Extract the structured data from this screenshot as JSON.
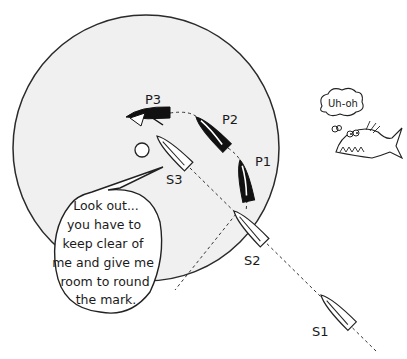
{
  "diagram": {
    "zone_circle": {
      "cx": 146,
      "cy": 148,
      "r": 133,
      "fill": "#f0f0f0",
      "stroke": "#2a2a2a"
    },
    "mark": {
      "cx": 142,
      "cy": 150,
      "r": 7
    },
    "boats": [
      {
        "id": "S1",
        "label": "S1",
        "color": "white",
        "label_pos": [
          312,
          336
        ]
      },
      {
        "id": "S2",
        "label": "S2",
        "color": "white",
        "label_pos": [
          244,
          265
        ]
      },
      {
        "id": "S3",
        "label": "S3",
        "color": "white",
        "label_pos": [
          166,
          184
        ]
      },
      {
        "id": "P1",
        "label": "P1",
        "color": "black",
        "label_pos": [
          255,
          166
        ]
      },
      {
        "id": "P2",
        "label": "P2",
        "color": "black",
        "label_pos": [
          222,
          124
        ]
      },
      {
        "id": "P3",
        "label": "P3",
        "color": "black",
        "label_pos": [
          145,
          104
        ]
      }
    ],
    "speech_bubble": {
      "lines": [
        "Look out...",
        "you have to",
        "keep clear of",
        "me and give me",
        "room to round",
        "the mark."
      ]
    },
    "fish": {
      "thought": "Uh-oh"
    }
  }
}
